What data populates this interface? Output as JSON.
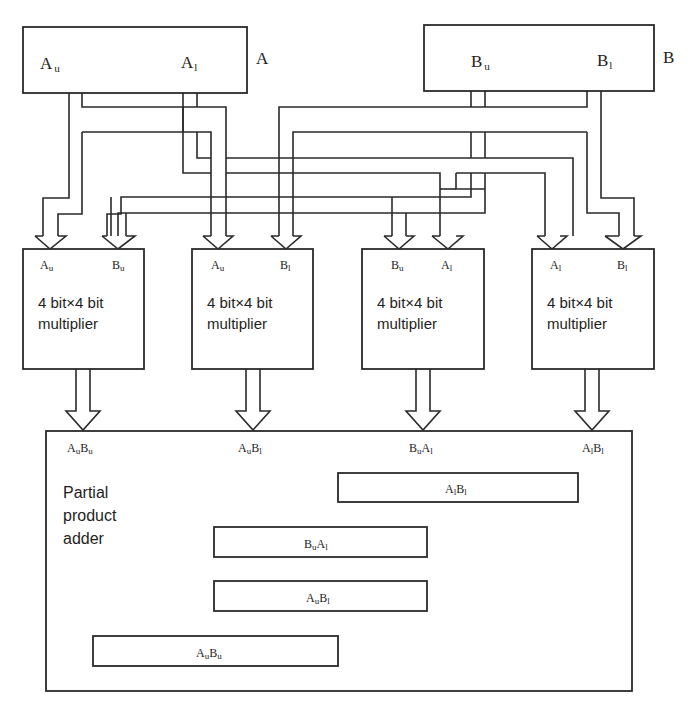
{
  "registers": {
    "a": {
      "name": "A",
      "upper": {
        "base": "A",
        "sub": "u"
      },
      "lower": {
        "base": "A",
        "sub": "l"
      }
    },
    "b": {
      "name": "B",
      "upper": {
        "base": "B",
        "sub": "u"
      },
      "lower": {
        "base": "B",
        "sub": "l"
      }
    }
  },
  "multipliers": [
    {
      "in1": {
        "base": "A",
        "sub": "u"
      },
      "in2": {
        "base": "B",
        "sub": "u"
      },
      "line1": "4 bit×4 bit",
      "line2": "multiplier",
      "out": [
        {
          "base": "A",
          "sub": "u"
        },
        {
          "base": "B",
          "sub": "u"
        }
      ]
    },
    {
      "in1": {
        "base": "A",
        "sub": "u"
      },
      "in2": {
        "base": "B",
        "sub": "l"
      },
      "line1": "4 bit×4 bit",
      "line2": "multiplier",
      "out": [
        {
          "base": "A",
          "sub": "u"
        },
        {
          "base": "B",
          "sub": "l"
        }
      ]
    },
    {
      "in1": {
        "base": "B",
        "sub": "u"
      },
      "in2": {
        "base": "A",
        "sub": "l"
      },
      "line1": "4 bit×4 bit",
      "line2": "multiplier",
      "out": [
        {
          "base": "B",
          "sub": "u"
        },
        {
          "base": "A",
          "sub": "l"
        }
      ]
    },
    {
      "in1": {
        "base": "A",
        "sub": "l"
      },
      "in2": {
        "base": "B",
        "sub": "l"
      },
      "line1": "4 bit×4 bit",
      "line2": "multiplier",
      "out": [
        {
          "base": "A",
          "sub": "l"
        },
        {
          "base": "B",
          "sub": "l"
        }
      ]
    }
  ],
  "adder": {
    "title_lines": [
      "Partial",
      "product",
      "adder"
    ],
    "bars": [
      {
        "terms": [
          {
            "base": "A",
            "sub": "l"
          },
          {
            "base": "B",
            "sub": "l"
          }
        ]
      },
      {
        "terms": [
          {
            "base": "B",
            "sub": "u"
          },
          {
            "base": "A",
            "sub": "l"
          }
        ]
      },
      {
        "terms": [
          {
            "base": "A",
            "sub": "u"
          },
          {
            "base": "B",
            "sub": "l"
          }
        ]
      },
      {
        "terms": [
          {
            "base": "A",
            "sub": "u"
          },
          {
            "base": "B",
            "sub": "u"
          }
        ]
      }
    ],
    "sum": {
      "parts": [
        "256",
        "A",
        "u",
        "B",
        "u",
        "+16",
        "A",
        "u",
        "B",
        "l",
        "+16",
        "B",
        "u",
        " A",
        "l",
        "+",
        "A",
        "l",
        "B",
        "l"
      ]
    }
  }
}
